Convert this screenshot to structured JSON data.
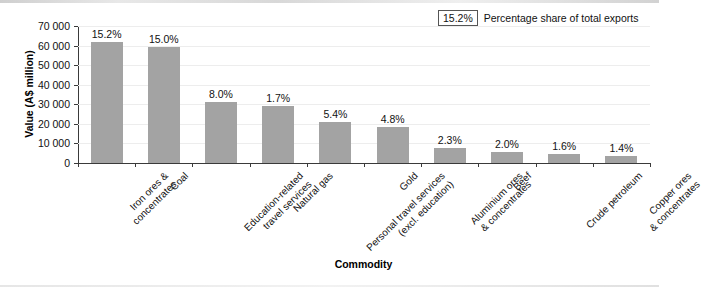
{
  "chart_data": {
    "type": "bar",
    "title": "",
    "xlabel": "Commodity",
    "ylabel": "Value (A$ million)",
    "ylim": [
      0,
      70000
    ],
    "ytick_step": 10000,
    "yticks": [
      "0",
      "10 000",
      "20 000",
      "30 000",
      "40 000",
      "50 000",
      "60 000",
      "70 000"
    ],
    "grid": true,
    "legend_position": "top-right",
    "categories": [
      "Iron ores &\nconcentrates",
      "Coal",
      "Education-related\ntravel services",
      "Natural gas",
      "Personal travel services\n(excl. education)",
      "Gold",
      "Aluminium ores\n& concentrates",
      "Beef",
      "Crude petroleum",
      "Copper ores\n& concentrates"
    ],
    "category_lines": [
      [
        "Iron ores &",
        "concentrates"
      ],
      [
        "Coal"
      ],
      [
        "Education-related",
        "travel services"
      ],
      [
        "Natural gas"
      ],
      [
        "Personal travel services",
        "(excl. education)"
      ],
      [
        "Gold"
      ],
      [
        "Aluminium ores",
        "& concentrates"
      ],
      [
        "Beef"
      ],
      [
        "Crude petroleum"
      ],
      [
        "Copper ores",
        "& concentrates"
      ]
    ],
    "values": [
      62000,
      59500,
      31000,
      29000,
      21000,
      18500,
      7500,
      5500,
      4500,
      3500
    ],
    "data_labels": [
      "15.2%",
      "15.0%",
      "8.0%",
      "1.7%",
      "5.4%",
      "4.8%",
      "2.3%",
      "2.0%",
      "1.6%",
      "1.4%"
    ],
    "series": [
      {
        "name": "Value (A$ million)",
        "values": [
          62000,
          59500,
          31000,
          29000,
          21000,
          18500,
          7500,
          5500,
          4500,
          3500
        ]
      }
    ]
  },
  "legend": {
    "swatch_text": "15.2%",
    "description": "Percentage share of total exports"
  },
  "colors": {
    "bar_fill": "#a3a3a3",
    "axis": "#3a3a3a",
    "gridline": "#ededed",
    "text": "#111111",
    "background": "#ffffff"
  }
}
